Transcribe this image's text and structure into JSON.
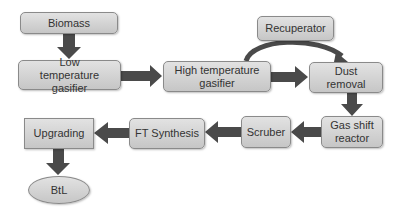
{
  "diagram": {
    "type": "process-flow",
    "nodes": [
      {
        "id": "biomass",
        "label": "Biomass"
      },
      {
        "id": "low_temp",
        "label": "Low temperature gasifier"
      },
      {
        "id": "high_temp",
        "label": "High temperature gasifier"
      },
      {
        "id": "recuperator",
        "label": "Recuperator"
      },
      {
        "id": "dust",
        "label": "Dust removal"
      },
      {
        "id": "gas_shift",
        "label": "Gas shift reactor"
      },
      {
        "id": "scruber",
        "label": "Scruber"
      },
      {
        "id": "ft",
        "label": "FT Synthesis"
      },
      {
        "id": "upgrading",
        "label": "Upgrading"
      },
      {
        "id": "btl",
        "label": "BtL"
      }
    ],
    "edges": [
      {
        "from": "biomass",
        "to": "low_temp"
      },
      {
        "from": "low_temp",
        "to": "high_temp"
      },
      {
        "from": "high_temp",
        "to": "dust"
      },
      {
        "from": "high_temp",
        "to": "dust",
        "via": "recuperator",
        "style": "curved"
      },
      {
        "from": "dust",
        "to": "gas_shift"
      },
      {
        "from": "gas_shift",
        "to": "scruber"
      },
      {
        "from": "scruber",
        "to": "ft"
      },
      {
        "from": "ft",
        "to": "upgrading"
      },
      {
        "from": "upgrading",
        "to": "btl"
      }
    ],
    "colors": {
      "box_fill": "#d4d4d4",
      "arrow": "#4a4a4a",
      "text": "#333333"
    }
  }
}
